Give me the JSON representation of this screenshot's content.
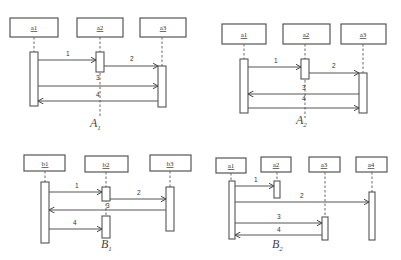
{
  "diagrams": [
    {
      "id": "A1",
      "caption": "A",
      "caption_sub": "1",
      "participants": [
        "a1",
        "a2",
        "a3"
      ],
      "messages": [
        {
          "label": "1",
          "from": "a1",
          "to": "a2"
        },
        {
          "label": "2",
          "from": "a2",
          "to": "a3"
        },
        {
          "label": "3",
          "from": "a1",
          "to": "a3"
        },
        {
          "label": "4",
          "from": "a3",
          "to": "a1"
        }
      ]
    },
    {
      "id": "A2",
      "caption": "A",
      "caption_sub": "2",
      "participants": [
        "a1",
        "a2",
        "a3"
      ],
      "messages": [
        {
          "label": "1",
          "from": "a1",
          "to": "a2"
        },
        {
          "label": "2",
          "from": "a2",
          "to": "a3"
        },
        {
          "label": "3",
          "from": "a3",
          "to": "a1"
        },
        {
          "label": "4",
          "from": "a1",
          "to": "a3"
        }
      ]
    },
    {
      "id": "B1",
      "caption": "B",
      "caption_sub": "1",
      "participants": [
        "b1",
        "b2",
        "b3"
      ],
      "messages": [
        {
          "label": "1",
          "from": "b1",
          "to": "b2"
        },
        {
          "label": "2",
          "from": "b2",
          "to": "b3"
        },
        {
          "label": "3",
          "from": "b3",
          "to": "b1"
        },
        {
          "label": "4",
          "from": "b1",
          "to": "b2"
        }
      ]
    },
    {
      "id": "B2",
      "caption": "B",
      "caption_sub": "2",
      "participants": [
        "a1",
        "a2",
        "a3",
        "a4"
      ],
      "messages": [
        {
          "label": "1",
          "from": "a1",
          "to": "a2"
        },
        {
          "label": "2",
          "from": "a1",
          "to": "a4"
        },
        {
          "label": "3",
          "from": "a1",
          "to": "a3"
        },
        {
          "label": "4",
          "from": "a3",
          "to": "a1"
        }
      ]
    }
  ]
}
